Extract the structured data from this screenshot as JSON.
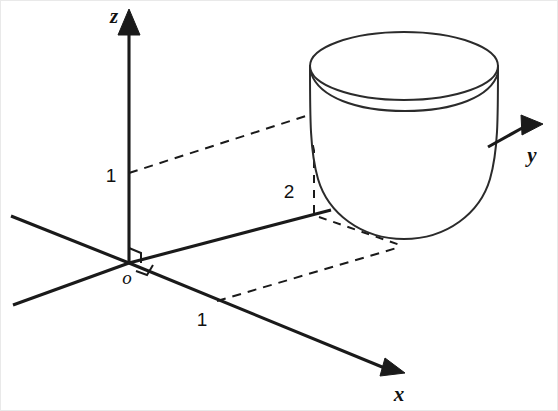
{
  "figure": {
    "title": "",
    "background_color": "#ffffff",
    "ink_color": "#1a1a1a",
    "width": 558,
    "height": 411
  },
  "axes": {
    "z": {
      "label": "z",
      "label_x": 113,
      "label_y": 22,
      "arrow": "up"
    },
    "y": {
      "label": "y",
      "label_x": 531,
      "label_y": 161,
      "arrow": "up-right"
    },
    "x": {
      "label": "x",
      "label_x": 398,
      "label_y": 400,
      "arrow": "down-right"
    },
    "origin": {
      "label": "o",
      "label_x": 126,
      "label_y": 283
    }
  },
  "ticks": [
    {
      "name": "z-tick-1",
      "label": "1",
      "axis": "z",
      "value": 1,
      "label_x": 110,
      "label_y": 181
    },
    {
      "name": "y-tick-2",
      "label": "2",
      "axis": "y",
      "value": 2,
      "label_x": 288,
      "label_y": 197
    },
    {
      "name": "x-tick-1",
      "label": "1",
      "axis": "x",
      "value": 1,
      "label_x": 201,
      "label_y": 325
    }
  ],
  "surface": {
    "name": "paraboloid-cup",
    "description": "elliptic paraboloid bowl opening upward",
    "rim_center_x": 403,
    "rim_center_y": 65,
    "rim_radius_x": 94,
    "rim_radius_y": 31,
    "bottom_y": 238
  },
  "guides": [
    {
      "name": "guide-z1-to-rim",
      "style": "dashed",
      "from": [
        128,
        172
      ],
      "to": [
        311,
        113
      ]
    },
    {
      "name": "guide-vertical-at-2",
      "style": "dashed",
      "from": [
        313,
        113
      ],
      "to": [
        313,
        212
      ]
    },
    {
      "name": "guide-x1-to-base",
      "style": "dashed",
      "from": [
        216,
        300
      ],
      "to": [
        401,
        245
      ]
    },
    {
      "name": "guide-y2-to-base",
      "style": "dashed",
      "from": [
        318,
        215
      ],
      "to": [
        400,
        243
      ]
    }
  ],
  "annotations": {
    "right_angle_markers": 2
  }
}
